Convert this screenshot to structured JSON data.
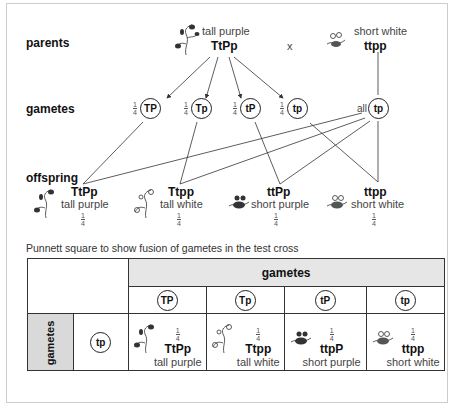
{
  "row_labels": {
    "parents": "parents",
    "gametes": "gametes",
    "offspring": "offspring"
  },
  "parents": {
    "left": {
      "phenotype": "tall purple",
      "genotype": "TtPp"
    },
    "cross": "x",
    "right": {
      "phenotype": "short white",
      "genotype": "ttpp"
    }
  },
  "gametes": {
    "left": [
      {
        "fraction_num": "1",
        "fraction_den": "4",
        "label": "TP"
      },
      {
        "fraction_num": "1",
        "fraction_den": "4",
        "label": "Tp"
      },
      {
        "fraction_num": "1",
        "fraction_den": "4",
        "label": "tP"
      },
      {
        "fraction_num": "1",
        "fraction_den": "4",
        "label": "tp"
      }
    ],
    "right": {
      "prefix": "all",
      "label": "tp"
    }
  },
  "offspring": [
    {
      "genotype": "TtPp",
      "phenotype": "tall purple",
      "fraction_num": "1",
      "fraction_den": "4"
    },
    {
      "genotype": "Ttpp",
      "phenotype": "tall white",
      "fraction_num": "1",
      "fraction_den": "4"
    },
    {
      "genotype": "ttPp",
      "phenotype": "short purple",
      "fraction_num": "1",
      "fraction_den": "4"
    },
    {
      "genotype": "ttpp",
      "phenotype": "short white",
      "fraction_num": "1",
      "fraction_den": "4"
    }
  ],
  "punnett": {
    "caption": "Punnett square to show fusion of gametes in the test cross",
    "col_header": "gametes",
    "row_header": "gametes",
    "col_gametes": [
      "TP",
      "Tp",
      "tP",
      "tp"
    ],
    "row_gametes": [
      "tp"
    ],
    "cells": [
      {
        "fraction_num": "1",
        "fraction_den": "4",
        "genotype": "TtPp",
        "phenotype": "tall purple"
      },
      {
        "fraction_num": "1",
        "fraction_den": "4",
        "genotype": "Ttpp",
        "phenotype": "tall white"
      },
      {
        "fraction_num": "1",
        "fraction_den": "4",
        "genotype": "ttpP",
        "phenotype": "short purple"
      },
      {
        "fraction_num": "1",
        "fraction_den": "4",
        "genotype": "ttpp",
        "phenotype": "short white"
      }
    ]
  },
  "colors": {
    "line": "#333333",
    "header_bg": "#e6e6e6",
    "side_bg": "#d9d9d9"
  }
}
